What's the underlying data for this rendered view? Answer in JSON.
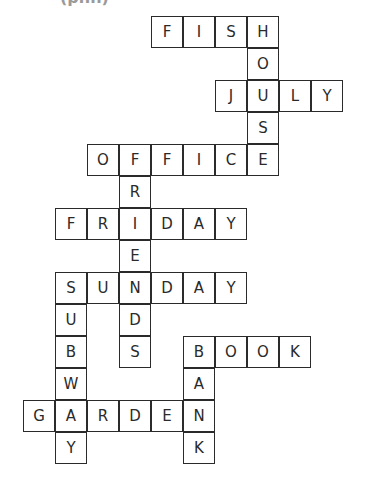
{
  "header": {
    "partial_text": "(pnn)"
  },
  "grid": {
    "origin_x": 23,
    "origin_y": 16,
    "cell_size": 32,
    "border_color": "#2b2b2b",
    "text_color": "#2a2a2a"
  },
  "words": [
    {
      "word": "FISH",
      "direction": "across",
      "row": 0,
      "col": 4
    },
    {
      "word": "HOUSE",
      "direction": "down",
      "row": 0,
      "col": 7
    },
    {
      "word": "JULY",
      "direction": "across",
      "row": 2,
      "col": 6
    },
    {
      "word": "OFFICE",
      "direction": "across",
      "row": 4,
      "col": 2
    },
    {
      "word": "FRIENDS",
      "direction": "down",
      "row": 4,
      "col": 3
    },
    {
      "word": "FRIDAY",
      "direction": "across",
      "row": 6,
      "col": 1
    },
    {
      "word": "SUNDAY",
      "direction": "across",
      "row": 8,
      "col": 1
    },
    {
      "word": "SUBWAY",
      "direction": "down",
      "row": 8,
      "col": 1
    },
    {
      "word": "BOOK",
      "direction": "across",
      "row": 10,
      "col": 5
    },
    {
      "word": "BANK",
      "direction": "down",
      "row": 10,
      "col": 5
    },
    {
      "word": "GARDEN",
      "direction": "across",
      "row": 12,
      "col": 0
    }
  ]
}
